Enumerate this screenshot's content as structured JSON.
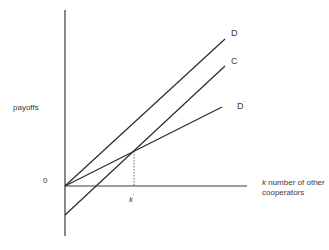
{
  "diagram": {
    "y_axis_label": "payoffs",
    "origin_label": "0",
    "x_axis_label_var": "k",
    "x_axis_label_line1": " number of other",
    "x_axis_label_line2": "cooperators",
    "threshold_label": "k",
    "threshold_sup": "'",
    "lines": [
      {
        "name": "D",
        "label": "D",
        "sup": ""
      },
      {
        "name": "C",
        "label": "C",
        "sup": ""
      },
      {
        "name": "D-prime",
        "label": "D",
        "sup": "'"
      }
    ],
    "line_color": "#2a2a2a"
  }
}
